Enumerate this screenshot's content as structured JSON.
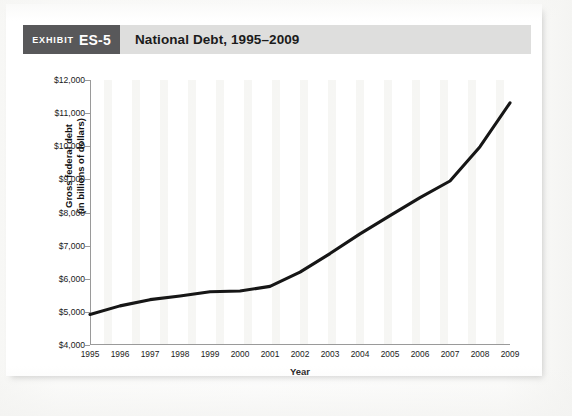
{
  "header": {
    "exhibit_kicker": "EXHIBIT",
    "exhibit_number": "ES-5",
    "title": "National Debt, 1995–2009",
    "badge_color": "#58585a",
    "bar_color": "#dededd"
  },
  "chart_data": {
    "type": "line",
    "title": "National Debt, 1995–2009",
    "xlabel": "Year",
    "ylabel": "Gross federal debt (in billions of dollars)",
    "ylabel_line1": "Gross federal debt",
    "ylabel_line2": "(in billions of dollars)",
    "categories": [
      1995,
      1996,
      1997,
      1998,
      1999,
      2000,
      2001,
      2002,
      2003,
      2004,
      2005,
      2006,
      2007,
      2008,
      2009
    ],
    "values": [
      4921,
      5181,
      5369,
      5478,
      5606,
      5629,
      5770,
      6198,
      6760,
      7355,
      7905,
      8451,
      8951,
      9986,
      11310
    ],
    "series": [
      {
        "name": "Gross federal debt",
        "values": [
          4921,
          5181,
          5369,
          5478,
          5606,
          5629,
          5770,
          6198,
          6760,
          7355,
          7905,
          8451,
          8951,
          9986,
          11310
        ]
      }
    ],
    "xlim": [
      1995,
      2009
    ],
    "ylim": [
      4000,
      12000
    ],
    "ytick_values": [
      12000,
      11000,
      10000,
      9000,
      8000,
      7000,
      6000,
      5000,
      4000
    ],
    "ytick_labels": [
      "$12,000",
      "$11,000",
      "$10,000",
      "$9,000",
      "$8,000",
      "$7,000",
      "$6,000",
      "$5,000",
      "$4,000"
    ],
    "xtick_labels": [
      "1995",
      "1996",
      "1997",
      "1998",
      "1999",
      "2000",
      "2001",
      "2002",
      "2003",
      "2004",
      "2005",
      "2006",
      "2007",
      "2008",
      "2009"
    ],
    "grid": false,
    "legend": "none",
    "line_color": "#161616",
    "axis_color": "#9a9a9a",
    "plot_background": "#ffffff"
  }
}
